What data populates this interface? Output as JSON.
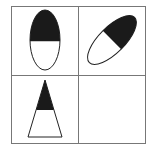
{
  "puzzle": {
    "grid": {
      "rows": 2,
      "cols": 2,
      "line_color": "#777777"
    },
    "cells": [
      {
        "position": "top-left",
        "shape": "ellipse",
        "orientation": "vertical",
        "filled_part": "top-half",
        "fill": "#1a1a1a"
      },
      {
        "position": "top-right",
        "shape": "ellipse",
        "orientation": "tilted-45",
        "filled_part": "upper-right-half",
        "fill": "#1a1a1a"
      },
      {
        "position": "bottom-left",
        "shape": "triangle",
        "orientation": "upright",
        "filled_part": "top-portion",
        "fill": "#1a1a1a"
      },
      {
        "position": "bottom-right",
        "shape": "empty",
        "orientation": "",
        "filled_part": "",
        "fill": ""
      }
    ]
  }
}
